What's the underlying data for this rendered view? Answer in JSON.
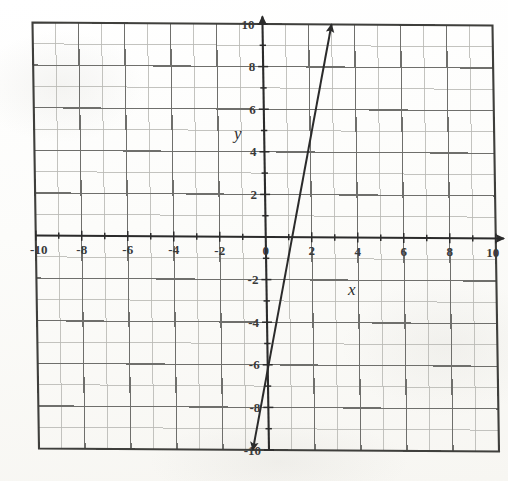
{
  "figure": {
    "kind": "coordinate-plane-graph",
    "background_color": "#fdfdfb",
    "ink_color": "#3a3a3a"
  },
  "axis_names": {
    "x": "x",
    "y": "y"
  },
  "chart_data": {
    "type": "line",
    "title": "",
    "xlabel": "x",
    "ylabel": "y",
    "xlim": [
      -10,
      10
    ],
    "ylim": [
      -10,
      10
    ],
    "grid": true,
    "grid_major_step": 2,
    "grid_minor_step": 1,
    "legend": "none",
    "x_tick_labels": [
      "-10",
      "-8",
      "-6",
      "-4",
      "-2",
      "0",
      "2",
      "4",
      "6",
      "8",
      "10"
    ],
    "x_tick_values": [
      -10,
      -8,
      -6,
      -4,
      -2,
      0,
      2,
      4,
      6,
      8,
      10
    ],
    "y_tick_labels": [
      "10",
      "8",
      "6",
      "4",
      "2",
      "-2",
      "-4",
      "-6",
      "-8",
      "-10"
    ],
    "y_tick_values": [
      10,
      8,
      6,
      4,
      2,
      -2,
      -4,
      -6,
      -8,
      -10
    ],
    "series": [
      {
        "name": "line",
        "equation": "y = 4x - 2",
        "slope": 4,
        "y_intercept": -2,
        "x_intercept": 0.5,
        "points": [
          [
            -2,
            -10
          ],
          [
            0,
            -2
          ],
          [
            1,
            2
          ],
          [
            2,
            6
          ],
          [
            3,
            10
          ]
        ],
        "endpoints": [
          [
            -0.7,
            -10
          ],
          [
            3.0,
            10
          ]
        ],
        "arrow_start": true,
        "arrow_end": true,
        "color": "#2b2b2b"
      }
    ]
  }
}
